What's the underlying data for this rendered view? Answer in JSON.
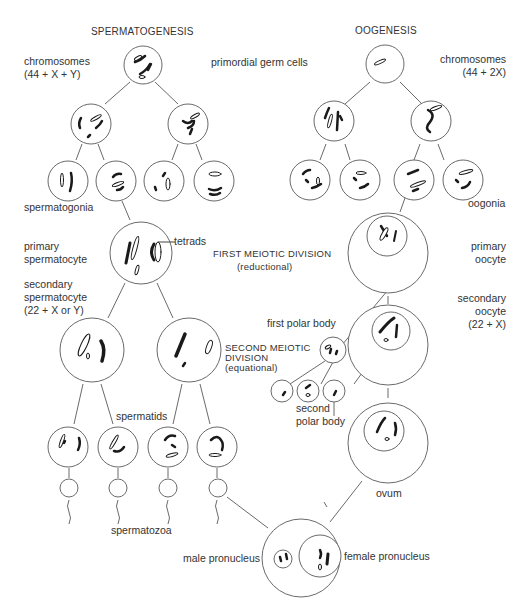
{
  "titles": {
    "left": "SPERMATOGENESIS",
    "right": "OOGENESIS"
  },
  "labels": {
    "chromosomes_male_1": "chromosomes",
    "chromosomes_male_2": "(44 + X + Y)",
    "primordial": "primordial germ cells",
    "chromosomes_female_1": "chromosomes",
    "chromosomes_female_2": "(44 + 2X)",
    "spermatogonia": "spermatogonia",
    "oogonia": "oogonia",
    "primary_spermatocyte_1": "primary",
    "primary_spermatocyte_2": "spermatocyte",
    "tetrads": "tetrads",
    "first_meiotic_1": "FIRST MEIOTIC DIVISION",
    "first_meiotic_2": "(reductional)",
    "primary_oocyte_1": "primary",
    "primary_oocyte_2": "oocyte",
    "secondary_spermatocyte_1": "secondary",
    "secondary_spermatocyte_2": "spermatocyte",
    "secondary_spermatocyte_3": "(22 + X or Y)",
    "secondary_oocyte_1": "secondary",
    "secondary_oocyte_2": "oocyte",
    "secondary_oocyte_3": "(22 + X)",
    "first_polar_body": "first polar body",
    "second_meiotic_1": "SECOND MEIOTIC",
    "second_meiotic_2": "DIVISION",
    "second_meiotic_3": "(equational)",
    "second_polar_body_1": "second",
    "second_polar_body_2": "polar body",
    "spermatids": "spermatids",
    "ovum": "ovum",
    "spermatozoa": "spermatozoa",
    "male_pronucleus": "male pronucleus",
    "female_pronucleus": "female pronucleus"
  },
  "colors": {
    "line": "#6a6a6a",
    "chromosome": "#1a1a1a",
    "text": "#333333"
  }
}
